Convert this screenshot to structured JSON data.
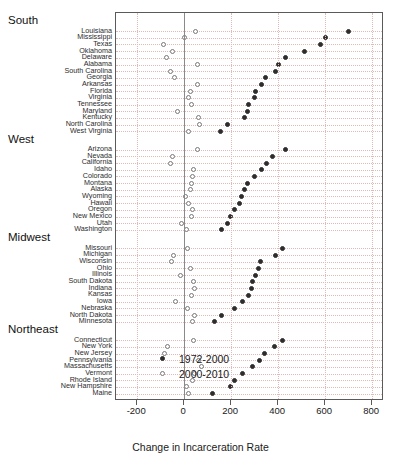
{
  "chart_data": {
    "type": "scatter",
    "title": "",
    "xlabel": "Change in Incarceration Rate",
    "ylabel": "",
    "xlim": [
      -290,
      850
    ],
    "xticks": [
      -200,
      0,
      200,
      400,
      600,
      800
    ],
    "xticklabels": [
      "-200",
      "0",
      "200",
      "400",
      "600",
      "800"
    ],
    "grid": true,
    "legend_position": "bottom-right",
    "legend": [
      {
        "label": "1972-2000",
        "marker": "filled-circle",
        "color": "#2d2d2d"
      },
      {
        "label": "2000-2010",
        "marker": "open-circle",
        "color": "#777777"
      }
    ],
    "series": [
      {
        "name": "1972-2000",
        "marker": "filled-circle"
      },
      {
        "name": "2000-2010",
        "marker": "open-circle"
      }
    ],
    "groups": [
      {
        "region": "South",
        "rows": [
          {
            "state": "Louisiana",
            "v1972_2000": 700,
            "v2000_2010": 50
          },
          {
            "state": "Mississippi",
            "v1972_2000": 600,
            "v2000_2010": 0
          },
          {
            "state": "Texas",
            "v1972_2000": 580,
            "v2000_2010": -90
          },
          {
            "state": "Oklahoma",
            "v1972_2000": 510,
            "v2000_2010": -50
          },
          {
            "state": "Delaware",
            "v1972_2000": 430,
            "v2000_2010": -75
          },
          {
            "state": "Alabama",
            "v1972_2000": 400,
            "v2000_2010": 55
          },
          {
            "state": "South Carolina",
            "v1972_2000": 390,
            "v2000_2010": -60
          },
          {
            "state": "Georgia",
            "v1972_2000": 345,
            "v2000_2010": -40
          },
          {
            "state": "Arkansas",
            "v1972_2000": 330,
            "v2000_2010": 55
          },
          {
            "state": "Florida",
            "v1972_2000": 305,
            "v2000_2010": 25
          },
          {
            "state": "Virginia",
            "v1972_2000": 300,
            "v2000_2010": 20
          },
          {
            "state": "Tennessee",
            "v1972_2000": 275,
            "v2000_2010": 30
          },
          {
            "state": "Maryland",
            "v1972_2000": 270,
            "v2000_2010": -30
          },
          {
            "state": "Kentucky",
            "v1972_2000": 255,
            "v2000_2010": 60
          },
          {
            "state": "North Carolina",
            "v1972_2000": 185,
            "v2000_2010": 65
          },
          {
            "state": "West Virginia",
            "v1972_2000": 155,
            "v2000_2010": 20
          }
        ]
      },
      {
        "region": "West",
        "rows": [
          {
            "state": "Arizona",
            "v1972_2000": 430,
            "v2000_2010": 55
          },
          {
            "state": "Nevada",
            "v1972_2000": 375,
            "v2000_2010": -50
          },
          {
            "state": "California",
            "v1972_2000": 350,
            "v2000_2010": -60
          },
          {
            "state": "Idaho",
            "v1972_2000": 330,
            "v2000_2010": 40
          },
          {
            "state": "Colorado",
            "v1972_2000": 300,
            "v2000_2010": 35
          },
          {
            "state": "Montana",
            "v1972_2000": 270,
            "v2000_2010": 30
          },
          {
            "state": "Alaska",
            "v1972_2000": 255,
            "v2000_2010": 25
          },
          {
            "state": "Wyoming",
            "v1972_2000": 245,
            "v2000_2010": 5
          },
          {
            "state": "Hawaii",
            "v1972_2000": 235,
            "v2000_2010": 20
          },
          {
            "state": "Oregon",
            "v1972_2000": 215,
            "v2000_2010": 35
          },
          {
            "state": "New Mexico",
            "v1972_2000": 195,
            "v2000_2010": 30
          },
          {
            "state": "Utah",
            "v1972_2000": 185,
            "v2000_2010": -10
          },
          {
            "state": "Washington",
            "v1972_2000": 160,
            "v2000_2010": 10
          }
        ]
      },
      {
        "region": "Midwest",
        "rows": [
          {
            "state": "Missouri",
            "v1972_2000": 420,
            "v2000_2010": 15
          },
          {
            "state": "Michigan",
            "v1972_2000": 390,
            "v2000_2010": -45
          },
          {
            "state": "Wisconsin",
            "v1972_2000": 325,
            "v2000_2010": -55
          },
          {
            "state": "Ohio",
            "v1972_2000": 315,
            "v2000_2010": 25
          },
          {
            "state": "Illinois",
            "v1972_2000": 305,
            "v2000_2010": -15
          },
          {
            "state": "South Dakota",
            "v1972_2000": 290,
            "v2000_2010": 40
          },
          {
            "state": "Indiana",
            "v1972_2000": 285,
            "v2000_2010": 45
          },
          {
            "state": "Kansas",
            "v1972_2000": 275,
            "v2000_2010": 30
          },
          {
            "state": "Iowa",
            "v1972_2000": 250,
            "v2000_2010": -35
          },
          {
            "state": "Nebraska",
            "v1972_2000": 215,
            "v2000_2010": 15
          },
          {
            "state": "North Dakota",
            "v1972_2000": 160,
            "v2000_2010": 45
          },
          {
            "state": "Minnesota",
            "v1972_2000": 130,
            "v2000_2010": 35
          }
        ]
      },
      {
        "region": "Northeast",
        "rows": [
          {
            "state": "Connecticut",
            "v1972_2000": 420,
            "v2000_2010": 40
          },
          {
            "state": "New York",
            "v1972_2000": 385,
            "v2000_2010": -70
          },
          {
            "state": "New Jersey",
            "v1972_2000": 340,
            "v2000_2010": -85
          },
          {
            "state": "Pennsylvania",
            "v1972_2000": 320,
            "v2000_2010": 60
          },
          {
            "state": "Massachusetts",
            "v1972_2000": 290,
            "v2000_2010": 75
          },
          {
            "state": "Vermont",
            "v1972_2000": 250,
            "v2000_2010": 45
          },
          {
            "state": "Rhode Island",
            "v1972_2000": 215,
            "v2000_2010": 35
          },
          {
            "state": "New Hampshire",
            "v1972_2000": 195,
            "v2000_2010": 10
          },
          {
            "state": "Maine",
            "v1972_2000": 120,
            "v2000_2010": 20
          }
        ]
      }
    ]
  }
}
